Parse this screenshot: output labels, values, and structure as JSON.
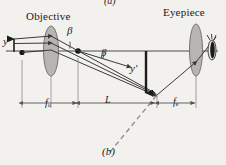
{
  "figure": {
    "panel_top_label": "(a)",
    "panel_bottom_label": "(b)",
    "background_color": "#f2f1ee",
    "ink_color": "#2b2b2b",
    "lens_fill_color": "#b6b5b2",
    "ray_color": "#3a3a3a",
    "dimension_color": "#6e6d6a"
  },
  "labels": {
    "objective": "Objective",
    "eyepiece": "Eyepiece",
    "beta_left": "β",
    "beta_right": "β",
    "object_height": "y",
    "image_height": "y′",
    "focal_objective": "f",
    "focal_objective_sub": "o",
    "tube_length": "L",
    "focal_eyepiece": "f",
    "focal_eyepiece_sub": "e"
  },
  "elements": {
    "objective_lens": "objective-lens",
    "eyepiece_lens": "eyepiece-lens",
    "optical_axis": "optical-axis",
    "eye": "eye-icon",
    "intermediate_image_arrow": "image-arrow",
    "object_arrow": "object-arrow",
    "focal_point_dot": "focal-point-dot",
    "object_point_dot": "object-point-dot",
    "dashed_ray": "dashed-extension-ray"
  },
  "dimensions": {
    "f_o_label": "f_o",
    "L_label": "L",
    "f_e_label": "f_e"
  }
}
